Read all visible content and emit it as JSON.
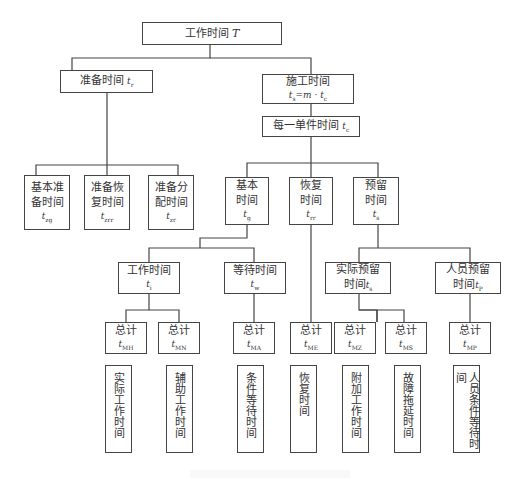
{
  "root": {
    "label": "工作时间",
    "symbol": "T"
  },
  "level1": {
    "prep": {
      "label": "准备时间",
      "symbol": "t",
      "sub": "r"
    },
    "construction": {
      "label": "施工时间",
      "formula_lhs": "t",
      "formula_lhs_sub": "s",
      "formula_rhs": "=m · t",
      "formula_rhs_sub": "c"
    }
  },
  "unit_time": {
    "label": "每一单件时间",
    "symbol": "t",
    "sub": "c"
  },
  "prep_children": [
    {
      "label_line1": "基本准",
      "label_line2": "备时间",
      "symbol": "t",
      "sub": "zg"
    },
    {
      "label_line1": "准备恢",
      "label_line2": "复时间",
      "symbol": "t",
      "sub": "zrr"
    },
    {
      "label_line1": "准备分",
      "label_line2": "配时间",
      "symbol": "t",
      "sub": "zr"
    }
  ],
  "unit_children": [
    {
      "label_line1": "基本",
      "label_line2": "时间",
      "symbol": "t",
      "sub": "g"
    },
    {
      "label_line1": "恢复",
      "label_line2": "时间",
      "symbol": "t",
      "sub": "rr"
    },
    {
      "label_line1": "预留",
      "label_line2": "时间",
      "symbol": "t",
      "sub": "s"
    }
  ],
  "level4": [
    {
      "label": "工作时间",
      "symbol": "t",
      "sub": "i"
    },
    {
      "label": "等待时间",
      "symbol": "t",
      "sub": "w"
    },
    {
      "label_line1": "实际预留",
      "label_line2": "时间",
      "symbol": "t",
      "sub": "s"
    },
    {
      "label_line1": "人员预留",
      "label_line2": "时间",
      "symbol": "t",
      "sub": "P"
    }
  ],
  "totals": [
    {
      "label": "总计",
      "symbol": "t",
      "sub": "MH"
    },
    {
      "label": "总计",
      "symbol": "t",
      "sub": "MN"
    },
    {
      "label": "总计",
      "symbol": "t",
      "sub": "MA"
    },
    {
      "label": "总计",
      "symbol": "t",
      "sub": "ME"
    },
    {
      "label": "总计",
      "symbol": "t",
      "sub": "MZ"
    },
    {
      "label": "总计",
      "symbol": "t",
      "sub": "MS"
    },
    {
      "label": "总计",
      "symbol": "t",
      "sub": "MP"
    }
  ],
  "leaves": [
    "实际工作时间",
    "辅助工作时间",
    "条件等待时间",
    "恢复时间",
    "附加工作时间",
    "故障拖延时间",
    "人员条件等待时间"
  ],
  "colors": {
    "line": "#444444",
    "text": "#333333",
    "background": "#ffffff"
  }
}
